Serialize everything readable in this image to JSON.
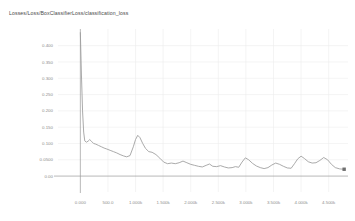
{
  "chart_title": "Losses/Loss/BoxClassifierLoss/classification_loss",
  "chart_data": {
    "type": "line",
    "title": "Losses/Loss/BoxClassifierLoss/classification_loss",
    "xlabel": "",
    "ylabel": "",
    "xlim": [
      -260,
      4850
    ],
    "ylim": [
      -0.012,
      0.445
    ],
    "grid": true,
    "legend": "none",
    "ytick_labels": [
      "0.400",
      "0.350",
      "0.300",
      "0.250",
      "0.200",
      "0.150",
      "0.100",
      "0.0500",
      "0.00"
    ],
    "ytick_values": [
      0.4,
      0.35,
      0.3,
      0.25,
      0.2,
      0.15,
      0.1,
      0.05,
      0.0
    ],
    "xtick_labels": [
      "0.000",
      "500.0",
      "1.000k",
      "1.500k",
      "2.000k",
      "2.500k",
      "3.000k",
      "3.500k",
      "4.000k",
      "4.500k"
    ],
    "xtick_values": [
      0,
      500,
      1000,
      1500,
      2000,
      2500,
      3000,
      3500,
      4000,
      4500
    ],
    "series": [
      {
        "name": "classification_loss",
        "color": "#9b9b9b",
        "end_marker": true,
        "x": [
          0,
          20,
          40,
          60,
          80,
          110,
          140,
          170,
          200,
          240,
          280,
          330,
          380,
          430,
          480,
          540,
          600,
          660,
          720,
          780,
          840,
          900,
          960,
          1000,
          1040,
          1080,
          1130,
          1180,
          1240,
          1300,
          1370,
          1440,
          1510,
          1580,
          1650,
          1720,
          1790,
          1860,
          1930,
          2000,
          2070,
          2140,
          2210,
          2280,
          2340,
          2400,
          2470,
          2540,
          2610,
          2680,
          2750,
          2810,
          2870,
          2930,
          2990,
          3050,
          3120,
          3190,
          3260,
          3330,
          3400,
          3470,
          3540,
          3610,
          3680,
          3750,
          3820,
          3880,
          3940,
          4000,
          4060,
          4130,
          4200,
          4270,
          4340,
          4410,
          4480,
          4550,
          4620,
          4700,
          4780
        ],
        "y": [
          0.44,
          0.31,
          0.2,
          0.135,
          0.108,
          0.104,
          0.107,
          0.112,
          0.107,
          0.1,
          0.098,
          0.094,
          0.09,
          0.086,
          0.083,
          0.079,
          0.075,
          0.071,
          0.066,
          0.062,
          0.059,
          0.063,
          0.09,
          0.112,
          0.125,
          0.118,
          0.1,
          0.085,
          0.075,
          0.073,
          0.066,
          0.055,
          0.043,
          0.038,
          0.04,
          0.038,
          0.041,
          0.046,
          0.041,
          0.036,
          0.033,
          0.03,
          0.028,
          0.033,
          0.037,
          0.03,
          0.029,
          0.032,
          0.028,
          0.025,
          0.026,
          0.029,
          0.027,
          0.043,
          0.056,
          0.05,
          0.039,
          0.031,
          0.026,
          0.023,
          0.026,
          0.034,
          0.04,
          0.036,
          0.03,
          0.025,
          0.024,
          0.038,
          0.053,
          0.061,
          0.054,
          0.044,
          0.04,
          0.041,
          0.048,
          0.057,
          0.05,
          0.036,
          0.026,
          0.022,
          0.021
        ]
      }
    ]
  }
}
